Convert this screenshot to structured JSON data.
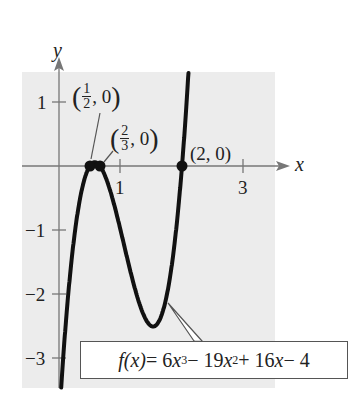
{
  "chart_data": {
    "type": "line",
    "title": "",
    "function": "f(x) = 6x^3 - 19x^2 + 16x - 4",
    "xlabel": "x",
    "ylabel": "y",
    "xlim": [
      -0.6,
      3.5
    ],
    "ylim": [
      -3.4,
      1.5
    ],
    "x_ticks": [
      1,
      3
    ],
    "y_ticks": [
      1,
      -1,
      -2,
      -3
    ],
    "grid": false,
    "background": "#ececec",
    "curve_color": "#111111",
    "zeros": [
      {
        "x": 0.5,
        "y": 0,
        "label": "(1/2, 0)"
      },
      {
        "x": 0.6667,
        "y": 0,
        "label": "(2/3, 0)"
      },
      {
        "x": 2,
        "y": 0,
        "label": "(2, 0)"
      }
    ],
    "local_max": {
      "x": 0.58,
      "y": 0.0
    },
    "local_min": {
      "x": 1.53,
      "y": -2.52
    },
    "annotations": [
      {
        "text": "(1/2, 0)",
        "points_to": [
          0.5,
          0
        ]
      },
      {
        "text": "(2/3, 0)",
        "points_to": [
          0.6667,
          0
        ]
      },
      {
        "text": "(2, 0)",
        "points_to": [
          2,
          0
        ]
      },
      {
        "text": "f(x) = 6x^3 - 19x^2 + 16x - 4",
        "points_to": [
          1.75,
          -2.0
        ]
      }
    ]
  },
  "labels": {
    "y_axis": "y",
    "x_axis": "x",
    "x_tick_1": "1",
    "x_tick_3": "3",
    "y_tick_1": "1",
    "y_tick_m1": "−1",
    "y_tick_m2": "−2",
    "y_tick_m3": "−3",
    "zero1": {
      "open": "(",
      "num": "1",
      "den": "2",
      "rest": ", 0",
      "close": ")"
    },
    "zero2": {
      "open": "(",
      "num": "2",
      "den": "3",
      "rest": ", 0",
      "close": ")"
    },
    "zero3": "(2, 0)",
    "equation": {
      "lhs": "f(x)",
      "eq": " = 6",
      "x1": "x",
      "p3": "3",
      "t2": " − 19",
      "x2": "x",
      "p2": "2",
      "t3": " + 16",
      "x3": "x",
      "t4": " − 4"
    }
  }
}
